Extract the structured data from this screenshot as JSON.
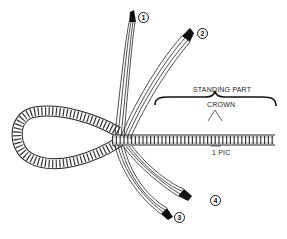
{
  "diagram": {
    "type": "rope-splice-illustration",
    "labels": {
      "standing_part": "STANDING PART",
      "crown": "CROWN",
      "pic": "1 PIC"
    },
    "strand_markers": [
      {
        "id": "1",
        "label": "1"
      },
      {
        "id": "2",
        "label": "2"
      },
      {
        "id": "3",
        "label": "3"
      },
      {
        "id": "4",
        "label": "4"
      }
    ],
    "colors": {
      "line": "#222222",
      "background": "#ffffff",
      "tip": "#111111"
    }
  }
}
